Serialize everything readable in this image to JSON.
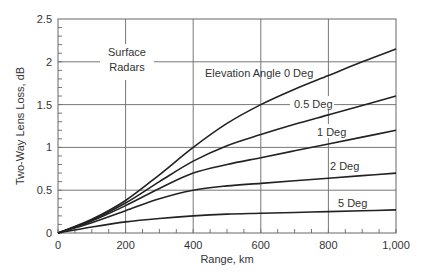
{
  "chart_data": {
    "type": "line",
    "title": "",
    "xlabel": "Range, km",
    "ylabel": "Two-Way Lens Loss, dB",
    "xlim": [
      0,
      1000
    ],
    "ylim": [
      0,
      2.5
    ],
    "xticks": [
      "0",
      "200",
      "400",
      "600",
      "800",
      "1,000"
    ],
    "yticks": [
      "0",
      "0.5",
      "1",
      "1.5",
      "2",
      "2.5"
    ],
    "grid": true,
    "annotations": [
      "Surface Radars"
    ],
    "x": [
      0,
      100,
      200,
      300,
      400,
      500,
      600,
      700,
      800,
      900,
      1000
    ],
    "series": [
      {
        "name": "Elevation Angle 0 Deg",
        "values": [
          0,
          0.16,
          0.38,
          0.68,
          1.0,
          1.28,
          1.5,
          1.68,
          1.84,
          2.0,
          2.15
        ]
      },
      {
        "name": "0.5 Deg",
        "values": [
          0,
          0.15,
          0.35,
          0.6,
          0.84,
          1.02,
          1.15,
          1.27,
          1.38,
          1.49,
          1.6
        ]
      },
      {
        "name": "1 Deg",
        "values": [
          0,
          0.14,
          0.32,
          0.52,
          0.7,
          0.8,
          0.88,
          0.96,
          1.04,
          1.12,
          1.2
        ]
      },
      {
        "name": "2 Deg",
        "values": [
          0,
          0.12,
          0.26,
          0.4,
          0.5,
          0.55,
          0.58,
          0.61,
          0.64,
          0.67,
          0.7
        ]
      },
      {
        "name": "5 Deg",
        "values": [
          0,
          0.07,
          0.13,
          0.17,
          0.2,
          0.22,
          0.23,
          0.24,
          0.25,
          0.26,
          0.27
        ]
      }
    ],
    "legend_position": "inline labels"
  },
  "labels": {
    "surface_line1": "Surface",
    "surface_line2": "Radars",
    "s0": "Elevation Angle 0 Deg",
    "s05": "0.5 Deg",
    "s1": "1 Deg",
    "s2": "2 Deg",
    "s5": "5 Deg"
  }
}
